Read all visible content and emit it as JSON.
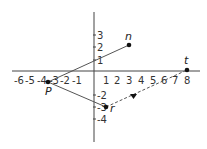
{
  "diagram": {
    "type": "coordinate-plane",
    "x_ticks": [
      "-6",
      "-5",
      "-4",
      "-3",
      "-2",
      "-1",
      "1",
      "2",
      "3",
      "4",
      "5",
      "6",
      "7",
      "8"
    ],
    "y_ticks_pos": [
      "1",
      "2",
      "3"
    ],
    "y_ticks_neg": [
      "-2",
      "-3",
      "-4"
    ],
    "points": [
      {
        "label": "n",
        "x": 3,
        "y": 2
      },
      {
        "label": "t",
        "x": 8,
        "y": 0
      },
      {
        "label": "P",
        "x": -4,
        "y": -1
      },
      {
        "label": "r",
        "x": 1,
        "y": -3
      }
    ],
    "segments": [
      {
        "from": "P",
        "to": "n",
        "style": "solid"
      },
      {
        "from": "P",
        "to": "r",
        "style": "solid"
      },
      {
        "from": "r",
        "to": "t",
        "style": "dashed",
        "arrow": "midpoint"
      }
    ],
    "colors": {
      "line": "#555555",
      "point": "#111111"
    }
  }
}
